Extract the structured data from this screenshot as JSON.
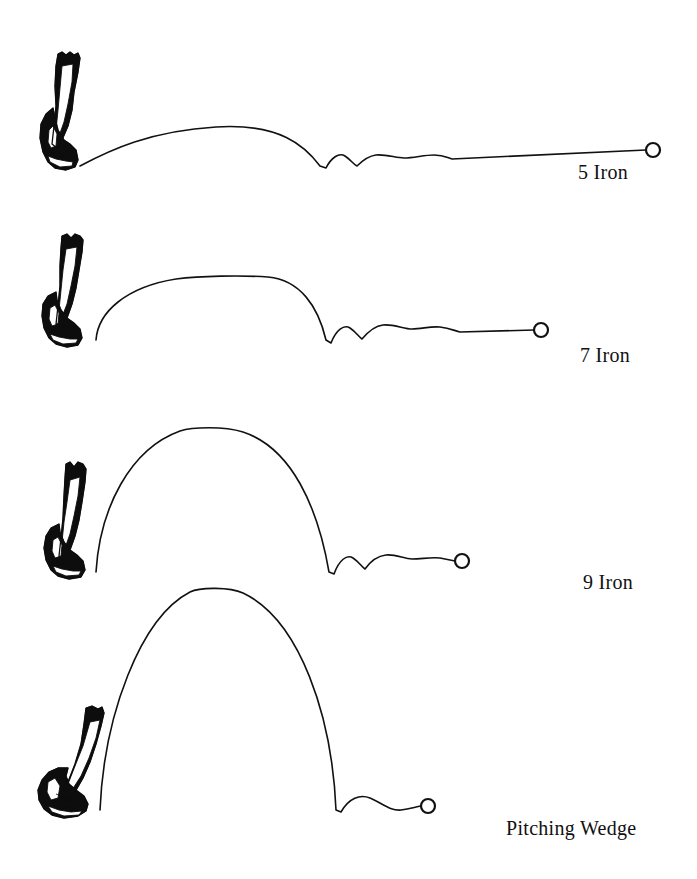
{
  "figure": {
    "kind": "golf-ball-flight-trajectory-diagram",
    "background_color": "#ffffff",
    "ink_color": "#111111",
    "width": 697,
    "height": 879
  },
  "shots": [
    {
      "id": "shot-5-iron",
      "label": "5 Iron",
      "label_x": 578,
      "label_y": 162,
      "ground_y": 166,
      "club_x": 40,
      "club_y": 52,
      "club_w": 62,
      "club_h": 118,
      "launch_x": 80,
      "apex_x": 216,
      "apex_y": 127,
      "apex_height": 39,
      "landing_x": 320,
      "ball_x": 653,
      "ball_y": 150,
      "ball_r": 7,
      "bounces": 2,
      "carry_px": 240,
      "roll_px": 333,
      "trajectory": "M80,166 C110,150 150,131 216,127 C280,123 305,146 320,166 L326,168 C331,158 339,152 345,156 C351,160 353,164 357,166 C361,162 368,156 376,155 C386,154 396,158 404,158 C414,158 424,155 434,155 C444,155 448,158 452,159 L646,150",
      "ball_path_note": "long low flight, two bounces, long run-out"
    },
    {
      "id": "shot-7-iron",
      "label": "7 Iron",
      "label_x": 580,
      "label_y": 345,
      "ground_y": 340,
      "club_x": 42,
      "club_y": 234,
      "club_w": 62,
      "club_h": 115,
      "launch_x": 96,
      "apex_x": 218,
      "apex_y": 276,
      "apex_height": 64,
      "landing_x": 326,
      "ball_x": 541,
      "ball_y": 330,
      "ball_r": 7,
      "bounces": 2,
      "carry_px": 230,
      "roll_px": 215,
      "trajectory": "M96,340 C98,312 126,287 176,279 C200,276 240,275 268,277 C300,280 318,306 326,340 L331,343 C336,330 344,324 350,328 C356,332 358,336 362,339 C367,333 374,326 383,325 C394,324 404,329 412,329 C422,329 430,326 440,327 C450,328 455,331 460,332 L534,330",
      "ball_path_note": "medium-high flight, two bounces, moderate run-out"
    },
    {
      "id": "shot-9-iron",
      "label": "9 Iron",
      "label_x": 583,
      "label_y": 572,
      "ground_y": 572,
      "club_x": 44,
      "club_y": 462,
      "club_w": 62,
      "club_h": 118,
      "launch_x": 96,
      "apex_x": 207,
      "apex_y": 427,
      "apex_height": 145,
      "landing_x": 329,
      "ball_x": 462,
      "ball_y": 561,
      "ball_r": 7,
      "bounces": 2,
      "carry_px": 233,
      "roll_px": 133,
      "trajectory": "M96,572 C100,508 130,449 180,431 C192,427 224,426 243,432 C292,448 318,508 329,572 L334,574 C339,560 347,554 353,558 C359,562 361,566 365,569 C370,562 377,556 386,555 C396,554 404,559 412,559 C422,559 430,557 440,558 L455,561",
      "ball_path_note": "high steep flight, two small bounces, short run-out"
    },
    {
      "id": "shot-pitching-wedge",
      "label": "Pitching Wedge",
      "label_x": 506,
      "label_y": 818,
      "ground_y": 810,
      "club_x": 38,
      "club_y": 706,
      "club_w": 68,
      "club_h": 112,
      "launch_x": 100,
      "apex_x": 215,
      "apex_y": 588,
      "apex_height": 222,
      "landing_x": 336,
      "ball_x": 428,
      "ball_y": 806,
      "ball_r": 7,
      "bounces": 1,
      "carry_px": 236,
      "roll_px": 92,
      "trajectory": "M100,810 C104,716 140,618 190,592 C200,587 230,587 243,593 C300,620 332,716 336,810 L341,812 C349,798 360,794 370,798 C382,803 390,811 401,810 C410,809 415,807 421,806",
      "ball_path_note": "highest, steepest flight, one bounce, almost no run-out"
    }
  ],
  "chart_data": {
    "type": "line",
    "xlabel": "Distance",
    "ylabel": "Height",
    "grid": false,
    "legend_position": "right-of-each-trajectory",
    "note": "Relative trajectory shapes for four irons: loft increases from 5 Iron to Pitching Wedge, producing progressively higher apex, shorter carry and less roll.",
    "categories": [
      "5 Iron",
      "7 Iron",
      "9 Iron",
      "Pitching Wedge"
    ],
    "series": [
      {
        "name": "Apex height (px)",
        "values": [
          39,
          64,
          145,
          222
        ]
      },
      {
        "name": "Carry distance (px)",
        "values": [
          240,
          230,
          233,
          236
        ]
      },
      {
        "name": "Roll distance (px)",
        "values": [
          333,
          215,
          133,
          92
        ]
      },
      {
        "name": "Bounces",
        "values": [
          2,
          2,
          2,
          1
        ]
      }
    ]
  }
}
